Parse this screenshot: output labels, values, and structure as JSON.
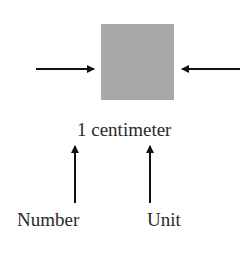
{
  "diagram": {
    "shape": {
      "type": "square",
      "color": "#a8a8a8"
    },
    "measurement_label": "1 centimeter",
    "annotations": [
      {
        "label": "Number",
        "points_to": "1"
      },
      {
        "label": "Unit",
        "points_to": "centimeter"
      }
    ],
    "arrow_color": "#111111"
  }
}
